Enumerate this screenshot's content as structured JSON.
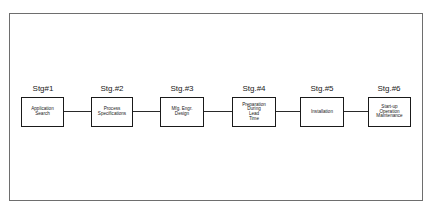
{
  "diagram": {
    "type": "process-flow",
    "stages": [
      {
        "label": "Stg#1",
        "box_text": "Application\nSearch"
      },
      {
        "label": "Stg.#2",
        "box_text": "Process\nSpecifications"
      },
      {
        "label": "Stg.#3",
        "box_text": "Mfg. Engr.\nDesign"
      },
      {
        "label": "Stg.#4",
        "box_text": "Preparation\nDuring\nLead\nTime"
      },
      {
        "label": "Stg.#5",
        "box_text": "Installation"
      },
      {
        "label": "Stg.#6",
        "box_text": "Start-up\nOperation\nMaintenance"
      }
    ],
    "colors": {
      "frame": "#6e6e6e",
      "box_border": "#1a1a1a",
      "connector": "#2a2a2a",
      "background": "#ffffff"
    }
  }
}
